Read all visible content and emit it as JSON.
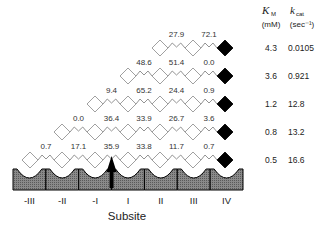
{
  "header": {
    "km_symbol": "K",
    "km_sub": "M",
    "km_unit": "(mM)",
    "kcat_symbol": "k",
    "kcat_sub": "cat",
    "kcat_unit": "(sec⁻¹)"
  },
  "axis": {
    "title": "Subsite",
    "subsites": [
      "-III",
      "-II",
      "-I",
      "I",
      "II",
      "III",
      "IV"
    ]
  },
  "rows": [
    {
      "bond_values": [
        "27.9",
        "72.1"
      ],
      "km": "4.3",
      "kcat": "0.0105"
    },
    {
      "bond_values": [
        "48.6",
        "51.4",
        "0.0"
      ],
      "km": "3.6",
      "kcat": "0.921"
    },
    {
      "bond_values": [
        "9.4",
        "65.2",
        "24.4",
        "0.9"
      ],
      "km": "1.2",
      "kcat": "12.8"
    },
    {
      "bond_values": [
        "0.0",
        "36.4",
        "33.9",
        "26.7",
        "3.6"
      ],
      "km": "0.8",
      "kcat": "13.2"
    },
    {
      "bond_values": [
        "0.7",
        "17.1",
        "35.9",
        "33.8",
        "11.7",
        "0.7"
      ],
      "km": "0.5",
      "kcat": "16.6"
    }
  ],
  "colors": {
    "block_fill": "#6e6e6e",
    "diamond_open": "#ffffff",
    "diamond_reducing_end": "#000000"
  }
}
